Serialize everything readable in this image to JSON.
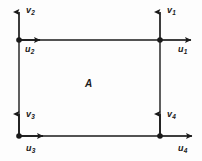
{
  "diagram": {
    "background_color": "#fdfdfd",
    "stroke_color": "#1a1a1a",
    "area_label": "A",
    "rectangle": {
      "left": 19,
      "top": 40,
      "right": 160,
      "bottom": 136,
      "width": 141,
      "height": 96
    },
    "nodes": [
      {
        "name": "node-top-right",
        "x": 160,
        "y": 40,
        "v_label": "v",
        "v_sub": "1",
        "u_label": "u",
        "u_sub": "1"
      },
      {
        "name": "node-top-left",
        "x": 19,
        "y": 40,
        "v_label": "v",
        "v_sub": "2",
        "u_label": "u",
        "u_sub": "2"
      },
      {
        "name": "node-bottom-left",
        "x": 19,
        "y": 136,
        "v_label": "v",
        "v_sub": "3",
        "u_label": "u",
        "u_sub": "3"
      },
      {
        "name": "node-bottom-right",
        "x": 160,
        "y": 136,
        "v_label": "v",
        "v_sub": "4",
        "u_label": "u",
        "u_sub": "4"
      }
    ],
    "labels": {
      "v1": {
        "text": "v",
        "sub": "1",
        "x": 167,
        "y": 6
      },
      "u1": {
        "text": "u",
        "sub": "1",
        "x": 178,
        "y": 45
      },
      "v2": {
        "text": "v",
        "sub": "2",
        "x": 26,
        "y": 6
      },
      "u2": {
        "text": "u",
        "sub": "2",
        "x": 25,
        "y": 45
      },
      "v3": {
        "text": "v",
        "sub": "3",
        "x": 26,
        "y": 110
      },
      "u3": {
        "text": "u",
        "sub": "3",
        "x": 26,
        "y": 144
      },
      "v4": {
        "text": "v",
        "sub": "4",
        "x": 167,
        "y": 110
      },
      "u4": {
        "text": "u",
        "sub": "4",
        "x": 178,
        "y": 144
      },
      "area": {
        "text": "A",
        "x": 85,
        "y": 79
      }
    }
  }
}
